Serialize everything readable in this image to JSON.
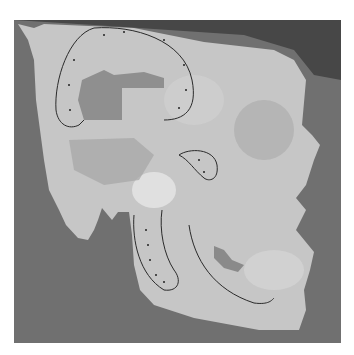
{
  "figure": {
    "colors": {
      "background": "#6f6f6f",
      "top_shadow": "#3e3e3e",
      "bone": "#c4c4c4",
      "bone_highlight": "#e2e2e2",
      "bone_shadow": "#9a9a9a",
      "outline": "#2a2a2a"
    },
    "marked_regions": [
      {
        "name": "parietal-temporal outline",
        "dotted": true
      },
      {
        "name": "zygomatic outline",
        "dotted": true
      },
      {
        "name": "mandibular ramus outline",
        "dotted": true
      },
      {
        "name": "mandibular body line",
        "dotted": false
      }
    ]
  }
}
